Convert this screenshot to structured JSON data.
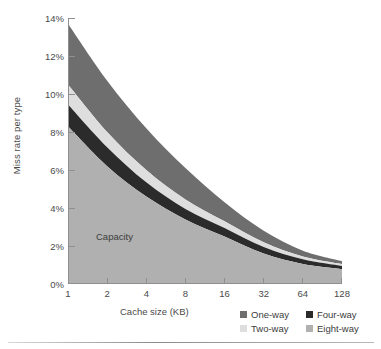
{
  "chart_data": {
    "type": "area",
    "stacked": true,
    "title": "",
    "xlabel": "Cache size (KB)",
    "ylabel": "Miss rate per type",
    "x": [
      1,
      2,
      4,
      8,
      16,
      32,
      64,
      128
    ],
    "categories": [
      "1",
      "2",
      "4",
      "8",
      "16",
      "32",
      "64",
      "128"
    ],
    "x_scale": "log2",
    "xtick_labels": [
      "1",
      "2",
      "4",
      "8",
      "16",
      "32",
      "64",
      "128"
    ],
    "ytick_labels": [
      "0%",
      "2%",
      "4%",
      "6%",
      "8%",
      "10%",
      "12%",
      "14%"
    ],
    "ytick_values": [
      0,
      2,
      4,
      6,
      8,
      10,
      12,
      14
    ],
    "ylim": [
      0,
      14
    ],
    "y_unit": "%",
    "grid": false,
    "legend_position": "bottom-right",
    "annotations": [
      {
        "text": "Capacity",
        "x": 2.6,
        "y": 2.0
      }
    ],
    "series": [
      {
        "name": "Eight-way",
        "color": "#b0b0b0",
        "legend_order": 4,
        "boundary_top": [
          8.3,
          6.2,
          4.6,
          3.4,
          2.5,
          1.6,
          1.05,
          0.78
        ],
        "values": [
          8.3,
          6.2,
          4.6,
          3.4,
          2.5,
          1.6,
          1.05,
          0.78
        ]
      },
      {
        "name": "Four-way",
        "color": "#2b2b2b",
        "legend_order": 3,
        "boundary_top": [
          9.45,
          7.2,
          5.35,
          3.95,
          2.95,
          1.95,
          1.3,
          0.95
        ],
        "values": [
          1.15,
          1.0,
          0.75,
          0.55,
          0.45,
          0.35,
          0.25,
          0.17
        ]
      },
      {
        "name": "Two-way",
        "color": "#dedede",
        "legend_order": 2,
        "boundary_top": [
          10.5,
          8.0,
          6.0,
          4.45,
          3.3,
          2.2,
          1.45,
          1.05
        ],
        "values": [
          1.05,
          0.8,
          0.65,
          0.5,
          0.35,
          0.25,
          0.15,
          0.1
        ]
      },
      {
        "name": "One-way",
        "color": "#6e6e6e",
        "legend_order": 1,
        "boundary_top": [
          13.7,
          10.7,
          8.2,
          6.1,
          4.3,
          2.8,
          1.75,
          1.2
        ],
        "values": [
          3.2,
          2.7,
          2.2,
          1.65,
          1.0,
          0.6,
          0.3,
          0.15
        ]
      }
    ]
  },
  "legend": {
    "items": [
      {
        "label": "One-way",
        "color": "#6e6e6e"
      },
      {
        "label": "Four-way",
        "color": "#2b2b2b"
      },
      {
        "label": "Two-way",
        "color": "#dedede"
      },
      {
        "label": "Eight-way",
        "color": "#b0b0b0"
      }
    ]
  },
  "axis": {
    "y_title": "Miss rate per type",
    "x_title": "Cache size (KB)"
  },
  "colors": {
    "axis_line": "#8f8f8f",
    "text": "#4a4a4a",
    "background": "#ffffff"
  }
}
